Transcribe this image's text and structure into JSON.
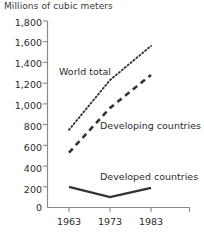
{
  "chart": {
    "title": "Millions of cubic meters",
    "y_axis": {
      "ticks": [
        "1,800",
        "1,600",
        "1,400",
        "1,200",
        "1,000",
        "800",
        "600",
        "400",
        "200",
        "0"
      ]
    },
    "x_axis": {
      "ticks": [
        "1963",
        "1973",
        "1983"
      ]
    },
    "series_labels": {
      "world_total": "World total",
      "developing": "Developing countries",
      "developed": "Developed countries"
    }
  },
  "chart_data": {
    "type": "line",
    "title": "Millions of cubic meters",
    "xlabel": "",
    "ylabel": "Millions of cubic meters",
    "x": [
      1963,
      1973,
      1983
    ],
    "xtick_labels": [
      "1963",
      "1973",
      "1983"
    ],
    "ylim": [
      0,
      1800
    ],
    "yticks": [
      0,
      200,
      400,
      600,
      800,
      1000,
      1200,
      1400,
      1600,
      1800
    ],
    "ytick_labels": [
      "0",
      "200",
      "400",
      "600",
      "800",
      "1,000",
      "1,200",
      "1,400",
      "1,600",
      "1,800"
    ],
    "grid": false,
    "legend": "inline-annotations",
    "series": [
      {
        "name": "World total",
        "style": "dotted",
        "color": "#333333",
        "values": [
          750,
          1230,
          1560
        ]
      },
      {
        "name": "Developing countries",
        "style": "dashed",
        "color": "#333333",
        "values": [
          530,
          960,
          1280
        ]
      },
      {
        "name": "Developed countries",
        "style": "solid",
        "color": "#333333",
        "values": [
          200,
          100,
          190
        ]
      }
    ],
    "annotations": [
      {
        "text": "World total",
        "near_series": "World total"
      },
      {
        "text": "Developing countries",
        "near_series": "Developing countries"
      },
      {
        "text": "Developed countries",
        "near_series": "Developed countries"
      }
    ]
  }
}
